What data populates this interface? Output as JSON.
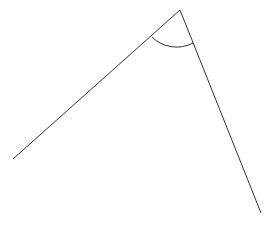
{
  "diagram": {
    "type": "angle",
    "stroke_color": "#333333",
    "background": "#ffffff",
    "vertex": {
      "x": 180,
      "y": 10
    },
    "ray_left_end": {
      "x": 13,
      "y": 159
    },
    "ray_right_end": {
      "x": 261,
      "y": 213
    },
    "arc": {
      "radius": 35,
      "start": {
        "x": 152,
        "y": 37
      },
      "end": {
        "x": 193,
        "y": 43
      }
    }
  }
}
